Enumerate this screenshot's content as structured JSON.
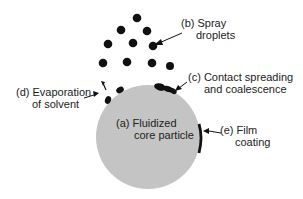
{
  "diagram": {
    "colors": {
      "particle": "#c4c4c4",
      "droplet": "#111111",
      "text": "#222222"
    },
    "particle": {
      "label_line1": "(a)  Fluidized",
      "label_line2": "core particle"
    },
    "labels": {
      "b_line1": "(b) Spray",
      "b_line2": "droplets",
      "c_line1": "(c)  Contact spreading",
      "c_line2": "and coalescence",
      "d_line1": "(d) Evaporation",
      "d_line2": "of solvent",
      "e_line1": "(e) Film",
      "e_line2": "coating"
    }
  }
}
